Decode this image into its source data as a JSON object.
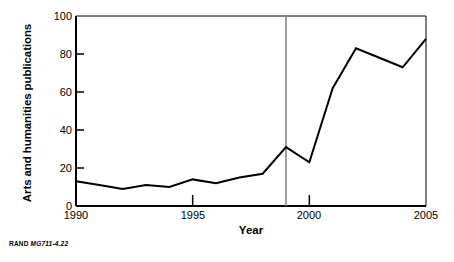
{
  "chart_data": {
    "type": "line",
    "title": "",
    "xlabel": "Year",
    "ylabel": "Arts and humanities publications",
    "x": [
      1990,
      1991,
      1992,
      1993,
      1994,
      1995,
      1996,
      1997,
      1998,
      1999,
      2000,
      2001,
      2002,
      2003,
      2004,
      2005
    ],
    "values": [
      13,
      11,
      9,
      11,
      10,
      14,
      12,
      15,
      17,
      31,
      23,
      62,
      83,
      78,
      73,
      88
    ],
    "series": [
      {
        "name": "Arts and humanities publications",
        "values": [
          13,
          11,
          9,
          11,
          10,
          14,
          12,
          15,
          17,
          31,
          23,
          62,
          83,
          78,
          73,
          88
        ]
      }
    ],
    "xlim": [
      1990,
      2005
    ],
    "ylim": [
      0,
      100
    ],
    "xticks": [
      1990,
      1995,
      2000,
      2005
    ],
    "xtick_labels": [
      "1990",
      "1995",
      "2000",
      "2005"
    ],
    "yticks": [
      0,
      20,
      40,
      60,
      80,
      100
    ],
    "ytick_labels": [
      "0",
      "20",
      "40",
      "60",
      "80",
      "100"
    ],
    "grid": false,
    "legend": "none",
    "annotations": [
      {
        "type": "vertical-reference-line",
        "x": 1999,
        "color": "#808080",
        "label": ""
      }
    ],
    "line_color": "#000000",
    "line_width": 2,
    "axis_color": "#000000",
    "background": "#ffffff"
  },
  "credit": {
    "organization": "RAND",
    "figure_code": "MG711-4.22"
  }
}
